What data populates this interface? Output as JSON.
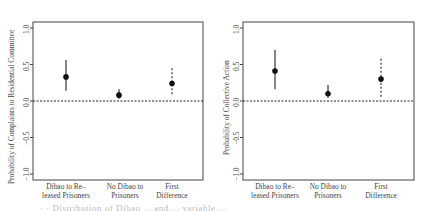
{
  "chart_data": [
    {
      "type": "scatter",
      "subtype": "point-range",
      "title": "",
      "xlabel": "",
      "ylabel": "Probability of Complaints to Residential Committee",
      "categories": [
        "Dibao to Re–\nleased Prisoners",
        "No Dibao to\nPrisoners",
        "First\nDifference"
      ],
      "series": [
        {
          "name": "estimate",
          "values": [
            0.33,
            0.08,
            0.24
          ],
          "lower": [
            0.14,
            0.03,
            0.07
          ],
          "upper": [
            0.56,
            0.16,
            0.45
          ],
          "line_style": [
            "solid",
            "solid",
            "dashed"
          ]
        }
      ],
      "yticks": [
        "−1.0",
        "−0.5",
        "0.0",
        "0.5",
        "1.0"
      ],
      "ylim": [
        -1.05,
        1.1
      ],
      "reference_line": {
        "y": 0.0,
        "style": "dotted"
      },
      "grid": false,
      "legend": null
    },
    {
      "type": "scatter",
      "subtype": "point-range",
      "title": "",
      "xlabel": "",
      "ylabel": "Probability of Collective Action",
      "categories": [
        "Dibao to Re–\nleased Prisoners",
        "No Dibao to\nPrisoners",
        "First\nDifference"
      ],
      "series": [
        {
          "name": "estimate",
          "values": [
            0.41,
            0.1,
            0.3
          ],
          "lower": [
            0.16,
            0.04,
            0.04
          ],
          "upper": [
            0.7,
            0.22,
            0.58
          ],
          "line_style": [
            "solid",
            "solid",
            "dashed"
          ]
        }
      ],
      "yticks": [
        "−1.0",
        "−0.5",
        "0.0",
        "0.5",
        "1.0"
      ],
      "ylim": [
        -1.05,
        1.1
      ],
      "reference_line": {
        "y": 0.0,
        "style": "dotted"
      },
      "grid": false,
      "legend": null
    }
  ],
  "left": {
    "ylabel": "Probability of Complaints to Residential Committee",
    "xticks": [
      "Dibao to Re–\nleased Prisoners",
      "No Dibao to\nPrisoners",
      "First\nDifference"
    ],
    "yticks": [
      "−1.0",
      "−0.5",
      "0.0",
      "0.5",
      "1.0"
    ]
  },
  "right": {
    "ylabel": "Probability of Collective Action",
    "xticks": [
      "Dibao to Re–\nleased Prisoners",
      "No Dibao to\nPrisoners",
      "First\nDifference"
    ],
    "yticks": [
      "−1.0",
      "−0.5",
      "0.0",
      "0.5",
      "1.0"
    ]
  },
  "caption": "·  ·  Distribution of Dibao ... and ... variable ... "
}
